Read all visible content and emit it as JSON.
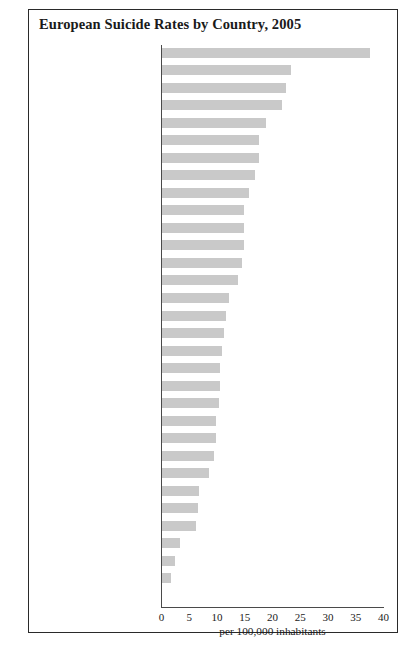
{
  "figure": {
    "title": "European Suicide Rates by Country, 2005",
    "xlabel": "per 100,000 inhabitants"
  },
  "chart_data": {
    "type": "bar",
    "orientation": "horizontal",
    "title": "European Suicide Rates by Country, 2005",
    "xlabel": "per 100,000 inhabitants",
    "ylabel": "",
    "xlim": [
      0,
      40
    ],
    "xticks": [
      0,
      5,
      10,
      15,
      20,
      25,
      30,
      35,
      40
    ],
    "grid": false,
    "legend": "none",
    "bar_color": "#c9c9c9",
    "categories": [
      "Lithuania",
      "Hungary",
      "Latvia",
      "Slovenia",
      "Estonia",
      "Belgium",
      "Finland",
      "Croatia",
      "France (metropolitan)",
      "Switzerland",
      "Poland",
      "Austria",
      "Czech Republic",
      "Sweden",
      "Slovakia",
      "Iceland",
      "Romania",
      "Norway",
      "Ireland",
      "Bulgaria",
      "Germany (with GDR)",
      "Denmark",
      "Luxembourg",
      "Netherlands",
      "Portugal",
      "The Former Yugoslav\nRepublic of Macedonia",
      "Spain",
      "United Kingdom",
      "Malta",
      "Greece",
      "Cyprus"
    ],
    "values": [
      37.5,
      23.4,
      22.5,
      21.8,
      18.9,
      17.6,
      17.5,
      16.9,
      15.7,
      14.9,
      14.8,
      14.8,
      14.5,
      13.8,
      12.2,
      11.6,
      11.2,
      10.9,
      10.6,
      10.5,
      10.3,
      9.9,
      9.9,
      9.4,
      8.6,
      6.8,
      6.5,
      6.2,
      3.4,
      2.5,
      1.8
    ]
  }
}
